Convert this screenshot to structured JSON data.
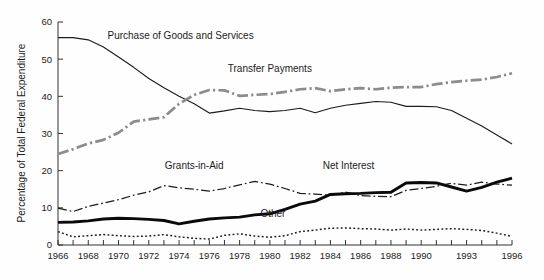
{
  "chart_data": {
    "type": "line",
    "title": "",
    "subtitle": "",
    "xlabel": "",
    "ylabel": "Percentage of Total Federal Expenditure",
    "xlim": [
      1966,
      1996
    ],
    "ylim": [
      0,
      60
    ],
    "ytick_values": [
      0,
      10,
      20,
      30,
      40,
      50,
      60
    ],
    "ytick_labels": [
      "0",
      "10",
      "20",
      "30",
      "40",
      "50",
      "60"
    ],
    "xtick_values": [
      1966,
      1967,
      1968,
      1969,
      1970,
      1971,
      1972,
      1973,
      1974,
      1975,
      1976,
      1977,
      1978,
      1979,
      1980,
      1981,
      1982,
      1983,
      1984,
      1985,
      1986,
      1987,
      1988,
      1989,
      1990,
      1991,
      1992,
      1993,
      1994,
      1995,
      1996
    ],
    "xtick_labels": [
      "1966",
      "1968",
      "1970",
      "1972",
      "1974",
      "1976",
      "1978",
      "1980",
      "1982",
      "1984",
      "1986",
      "1988",
      "1990",
      "1993",
      "1996"
    ],
    "xtick_labeled_values": [
      1966,
      1968,
      1970,
      1972,
      1974,
      1976,
      1978,
      1980,
      1982,
      1984,
      1986,
      1988,
      1990,
      1993,
      1996
    ],
    "grid": false,
    "legend_position": "inline-annotations",
    "x": [
      1966,
      1967,
      1968,
      1969,
      1970,
      1971,
      1972,
      1973,
      1974,
      1975,
      1976,
      1977,
      1978,
      1979,
      1980,
      1981,
      1982,
      1983,
      1984,
      1985,
      1986,
      1987,
      1988,
      1989,
      1990,
      1991,
      1992,
      1993,
      1994,
      1995,
      1996
    ],
    "series": [
      {
        "name": "Purchase of Goods and Services",
        "style": "solid-thin",
        "color": "#1c1c1c",
        "annotation_label": "Purchase of Goods and Services",
        "values": [
          55.8,
          55.8,
          55.2,
          53.3,
          50.6,
          47.8,
          44.8,
          42.3,
          40.0,
          38.0,
          35.5,
          36.1,
          36.8,
          36.2,
          35.9,
          36.2,
          36.8,
          35.6,
          36.8,
          37.6,
          38.1,
          38.6,
          38.4,
          37.3,
          37.3,
          37.2,
          36.2,
          34.1,
          32.0,
          29.6,
          27.2
        ]
      },
      {
        "name": "Transfer Payments",
        "style": "dashdot-thick-gray",
        "color": "#8c8c8c",
        "annotation_label": "Transfer Payments",
        "values": [
          24.5,
          25.8,
          27.3,
          28.3,
          30.2,
          33.2,
          33.8,
          34.4,
          38.0,
          40.4,
          41.7,
          41.6,
          40.1,
          40.4,
          40.6,
          41.2,
          41.9,
          42.2,
          41.4,
          41.9,
          42.2,
          41.9,
          42.3,
          42.5,
          42.5,
          43.3,
          43.8,
          44.2,
          44.5,
          45.2,
          46.2
        ]
      },
      {
        "name": "Grants-in-Aid",
        "style": "dashdot-thin",
        "color": "#1c1c1c",
        "annotation_label": "Grants-in-Aid",
        "values": [
          9.9,
          9.0,
          10.4,
          11.3,
          12.2,
          13.4,
          14.3,
          16.0,
          15.4,
          15.0,
          14.5,
          15.2,
          16.2,
          17.1,
          16.4,
          15.2,
          13.9,
          13.7,
          13.4,
          14.2,
          13.3,
          13.1,
          13.0,
          14.7,
          15.2,
          15.8,
          16.6,
          16.1,
          16.9,
          16.4,
          16.1
        ]
      },
      {
        "name": "Net Interest",
        "style": "solid-thick",
        "color": "#0a0a0a",
        "annotation_label": "Net Interest",
        "values": [
          6.1,
          6.2,
          6.5,
          7.0,
          7.2,
          7.1,
          6.9,
          6.6,
          5.7,
          6.4,
          7.0,
          7.3,
          7.5,
          8.1,
          8.4,
          9.6,
          11.0,
          11.8,
          13.6,
          13.8,
          13.9,
          14.1,
          14.2,
          16.7,
          16.8,
          16.7,
          15.6,
          14.5,
          15.5,
          16.9,
          18.0
        ]
      },
      {
        "name": "Other",
        "style": "dotted",
        "color": "#1c1c1c",
        "annotation_label": "Other",
        "values": [
          3.6,
          2.2,
          2.5,
          2.8,
          2.5,
          2.3,
          2.4,
          2.8,
          2.2,
          1.8,
          1.6,
          2.6,
          3.0,
          2.4,
          2.1,
          2.5,
          3.6,
          4.0,
          4.5,
          4.6,
          4.4,
          4.3,
          4.0,
          4.3,
          4.0,
          4.2,
          4.4,
          4.2,
          3.9,
          3.2,
          2.3
        ]
      }
    ],
    "annotations": [
      {
        "label": "Purchase of Goods and Services",
        "x": 1974.1,
        "y": 55.5,
        "anchor": "middle"
      },
      {
        "label": "Transfer Payments",
        "x": 1980.0,
        "y": 46.5,
        "anchor": "middle"
      },
      {
        "label": "Grants-in-Aid",
        "x": 1975.0,
        "y": 20.5,
        "anchor": "middle"
      },
      {
        "label": "Net Interest",
        "x": 1985.2,
        "y": 20.5,
        "anchor": "middle"
      },
      {
        "label": "Other",
        "x": 1980.2,
        "y": 7.6,
        "anchor": "middle"
      }
    ]
  }
}
